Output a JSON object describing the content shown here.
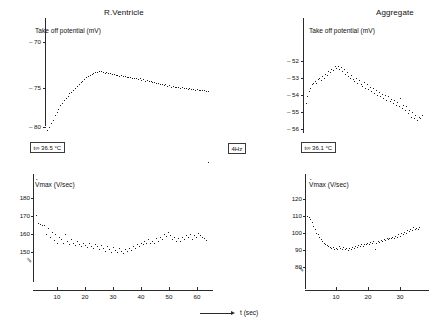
{
  "figure": {
    "xaxis_label": "t (sec)",
    "stimulus_box": "4Hz"
  },
  "panels": [
    {
      "id": "rv-top",
      "title": "R.Ventricle",
      "ylabel": "Take off potential (mV)",
      "ytick_labels": [
        "– 70",
        "– 75",
        "– 80"
      ],
      "annotation": {
        "symbol": "t",
        "subscript": "∞",
        "value": "36.5",
        "unit": "°C",
        "text": "t∞ 36.5 °C"
      }
    },
    {
      "id": "agg-top",
      "title": "Aggregate",
      "ylabel": "Take off potential (mV)",
      "ytick_labels": [
        "– 52",
        "– 53",
        "– 54",
        "– 55",
        "– 56"
      ],
      "annotation": {
        "symbol": "t",
        "subscript": "∞",
        "value": "36.1",
        "unit": "°C",
        "text": "t∞ 36.1 °C"
      }
    },
    {
      "id": "rv-bottom",
      "title": "",
      "ylabel": "Vmax (V/sec)",
      "ylabel_prefix": "V",
      "ylabel_suffix": "max (V/sec)",
      "ytick_labels": [
        "180",
        "170",
        "160",
        "150"
      ],
      "xtick_labels": [
        "10",
        "20",
        "30",
        "40",
        "50",
        "60"
      ]
    },
    {
      "id": "agg-bottom",
      "title": "",
      "ylabel": "Vmax (V/sec)",
      "ylabel_prefix": "V",
      "ylabel_suffix": "max (V/sec)",
      "ytick_labels": [
        "120",
        "110",
        "100",
        "90",
        "80"
      ],
      "xtick_labels": [
        "10",
        "20",
        "30"
      ]
    }
  ],
  "chart_data": [
    {
      "type": "scatter",
      "id": "rv-takeoff",
      "title": "R.Ventricle",
      "xlabel": "t (sec)",
      "ylabel": "Take off potential (mV)",
      "ylim": [
        -81.5,
        -68.5
      ],
      "xlim": [
        0,
        63
      ],
      "yticks": [
        -70,
        -75,
        -80
      ],
      "grid": false,
      "legend": null,
      "annotation": "t∞ 36.5 °C",
      "x": [
        0.5,
        1.2,
        1.9,
        2.6,
        3.3,
        4,
        4.7,
        5.4,
        6.1,
        6.8,
        7.5,
        8.2,
        8.9,
        9.6,
        10.3,
        11,
        11.7,
        12.4,
        13.1,
        13.8,
        14.5,
        15.2,
        15.9,
        16.6,
        17.3,
        18,
        18.7,
        19.4,
        20.1,
        20.8,
        21.5,
        22.2,
        22.9,
        23.6,
        24.3,
        25,
        25.7,
        26.4,
        27.1,
        27.8,
        28.5,
        29.2,
        29.9,
        30.6,
        31.3,
        32,
        32.7,
        33.4,
        34.1,
        34.8,
        35.5,
        36.2,
        36.9,
        37.6,
        38.3,
        39,
        39.7,
        40.4,
        41.1,
        41.8,
        42.5,
        43.2,
        43.9,
        44.6,
        45.3,
        46,
        46.7,
        47.4,
        48.1,
        48.8,
        49.5,
        50.2,
        50.9,
        51.6,
        52.3,
        53,
        53.7,
        54.4,
        55.1,
        55.8,
        56.5,
        57.2,
        57.9,
        58.6,
        59.3,
        60,
        60.7,
        61.4
      ],
      "y": [
        -80.4,
        -80.1,
        -79.6,
        -79.2,
        -78.7,
        -78.3,
        -77.9,
        -77.5,
        -77.2,
        -76.9,
        -76.6,
        -76.4,
        -76.1,
        -75.9,
        -75.7,
        -75.5,
        -75.2,
        -75.0,
        -74.8,
        -74.6,
        -74.4,
        -74.2,
        -74.0,
        -73.9,
        -73.8,
        -73.7,
        -73.6,
        -73.55,
        -73.5,
        -73.5,
        -73.6,
        -73.7,
        -73.6,
        -73.75,
        -73.7,
        -73.8,
        -73.85,
        -73.9,
        -73.95,
        -74.0,
        -73.95,
        -74.05,
        -74.1,
        -74.15,
        -74.2,
        -74.15,
        -74.25,
        -74.3,
        -74.35,
        -74.4,
        -74.35,
        -74.5,
        -74.45,
        -74.6,
        -74.55,
        -74.7,
        -74.65,
        -74.8,
        -74.75,
        -74.9,
        -74.85,
        -75.0,
        -74.95,
        -75.1,
        -75.05,
        -75.2,
        -75.15,
        -75.3,
        -75.25,
        -75.35,
        -75.3,
        -75.4,
        -75.45,
        -75.4,
        -75.5,
        -75.45,
        -75.55,
        -75.5,
        -75.6,
        -75.55,
        -75.65,
        -75.6,
        -75.7,
        -75.65,
        -75.75,
        -75.7,
        -75.8,
        -75.85
      ]
    },
    {
      "type": "scatter",
      "id": "agg-takeoff",
      "title": "Aggregate",
      "xlabel": "t (sec)",
      "ylabel": "Take off potential (mV)",
      "ylim": [
        -56.6,
        -51.4
      ],
      "xlim": [
        0,
        33
      ],
      "yticks": [
        -52,
        -53,
        -54,
        -55,
        -56
      ],
      "grid": false,
      "legend": null,
      "annotation": "t∞ 36.1 °C",
      "x": [
        0.4,
        0.8,
        1.2,
        1.6,
        2,
        2.4,
        2.8,
        3.2,
        3.6,
        4,
        4.4,
        4.8,
        5.2,
        5.6,
        6,
        6.4,
        6.8,
        7.2,
        7.6,
        8,
        8.4,
        8.8,
        9.2,
        9.6,
        10,
        10.4,
        10.8,
        11.2,
        11.6,
        12,
        12.4,
        12.8,
        13.2,
        13.6,
        14,
        14.4,
        14.8,
        15.2,
        15.6,
        16,
        16.4,
        16.8,
        17.2,
        17.6,
        18,
        18.4,
        18.8,
        19.2,
        19.6,
        20,
        20.4,
        20.8,
        21.2,
        21.6,
        22,
        22.4,
        22.8,
        23.2,
        23.6,
        24,
        24.4,
        24.8,
        25.2,
        25.6,
        26,
        26.4,
        26.8,
        27.2,
        27.6,
        28,
        28.4,
        28.8,
        29.2,
        29.6,
        30,
        30.4,
        30.8
      ],
      "y": [
        -54.5,
        -54.1,
        -53.8,
        -53.6,
        -53.4,
        -53.3,
        -53.2,
        -53.3,
        -53.1,
        -53.0,
        -53.15,
        -52.9,
        -53.0,
        -52.8,
        -52.85,
        -52.6,
        -52.7,
        -52.5,
        -52.55,
        -52.35,
        -52.45,
        -52.3,
        -52.5,
        -52.4,
        -52.6,
        -52.5,
        -52.8,
        -52.7,
        -52.9,
        -53.0,
        -52.85,
        -53.1,
        -53.2,
        -53.05,
        -53.3,
        -53.15,
        -53.4,
        -53.5,
        -53.25,
        -53.6,
        -53.4,
        -53.7,
        -53.55,
        -53.8,
        -53.6,
        -53.9,
        -53.75,
        -54.0,
        -53.85,
        -54.1,
        -53.95,
        -54.2,
        -54.0,
        -54.3,
        -54.1,
        -54.4,
        -54.25,
        -54.5,
        -54.3,
        -54.6,
        -54.45,
        -54.7,
        -54.2,
        -54.8,
        -54.6,
        -54.9,
        -54.7,
        -55.1,
        -54.9,
        -55.3,
        -55.0,
        -55.4,
        -55.2,
        -55.5,
        -55.3,
        -55.4,
        -55.2
      ]
    },
    {
      "type": "scatter",
      "id": "rv-vmax",
      "title": "",
      "xlabel": "t (sec)",
      "ylabel": "Vmax (V/sec)",
      "ylim": [
        144,
        184
      ],
      "xlim": [
        0,
        63
      ],
      "yticks": [
        180,
        170,
        160,
        150
      ],
      "xticks": [
        10,
        20,
        30,
        40,
        50,
        60
      ],
      "grid": false,
      "legend": null,
      "x": [
        0.6,
        1.3,
        2,
        2.7,
        3.4,
        4.1,
        4.8,
        5.5,
        6.2,
        6.9,
        7.6,
        8.3,
        9,
        9.7,
        10.4,
        11.1,
        11.8,
        12.5,
        13.2,
        13.9,
        14.6,
        15.3,
        16,
        16.7,
        17.4,
        18.1,
        18.8,
        19.5,
        20.2,
        20.9,
        21.6,
        22.3,
        23,
        23.7,
        24.4,
        25.1,
        25.8,
        26.5,
        27.2,
        27.9,
        28.6,
        29.3,
        30,
        30.7,
        31.4,
        32.1,
        32.8,
        33.5,
        34.2,
        34.9,
        35.6,
        36.3,
        37,
        37.7,
        38.4,
        39.1,
        39.8,
        40.5,
        41.2,
        41.9,
        42.6,
        43.3,
        44,
        44.7,
        45.4,
        46.1,
        46.8,
        47.5,
        48.2,
        48.9,
        49.6,
        50.3,
        51,
        51.7,
        52.4,
        53.1,
        53.8,
        54.5,
        55.2,
        55.9,
        56.6,
        57.3,
        58,
        58.7,
        59.4,
        60.1,
        60.8,
        61.5
      ],
      "y": [
        170.5,
        166,
        165.5,
        165,
        164.5,
        160,
        163,
        158,
        161,
        156.5,
        160,
        155,
        158,
        157,
        155,
        159.5,
        156,
        154,
        157,
        155,
        153.5,
        156,
        154,
        153,
        155,
        153.5,
        152.5,
        154.5,
        153,
        152,
        154,
        153,
        151.5,
        153.5,
        152,
        150.5,
        153,
        151.5,
        150,
        152.5,
        151,
        149.5,
        152,
        150.5,
        149,
        151.5,
        150.5,
        152,
        151,
        153,
        152,
        154,
        153,
        155,
        154,
        156,
        155,
        157,
        154.5,
        156,
        155,
        157.5,
        156,
        158,
        157,
        160,
        158.5,
        161,
        159,
        157,
        158,
        156,
        157.5,
        156,
        158,
        157,
        159,
        158,
        160,
        157,
        159,
        158,
        160.5,
        159,
        158,
        157.5,
        156.5
      ]
    },
    {
      "type": "scatter",
      "id": "agg-vmax",
      "title": "",
      "xlabel": "t (sec)",
      "ylabel": "Vmax (V/sec)",
      "ylim": [
        74,
        124
      ],
      "xlim": [
        0,
        33
      ],
      "yticks": [
        120,
        110,
        100,
        90,
        80
      ],
      "xticks": [
        10,
        20,
        30
      ],
      "grid": false,
      "legend": null,
      "x": [
        0.4,
        0.8,
        1.2,
        1.6,
        2,
        2.4,
        2.8,
        3.2,
        3.6,
        4,
        4.4,
        4.8,
        5.2,
        5.6,
        6,
        6.4,
        6.8,
        7.2,
        7.6,
        8,
        8.4,
        8.8,
        9.2,
        9.6,
        10,
        10.4,
        10.8,
        11.2,
        11.6,
        12,
        12.4,
        12.8,
        13.2,
        13.6,
        14,
        14.4,
        14.8,
        15.2,
        15.6,
        16,
        16.4,
        16.8,
        17.2,
        17.6,
        18,
        18.4,
        18.8,
        19.2,
        19.6,
        20,
        20.4,
        20.8,
        21.2,
        21.6,
        22,
        22.4,
        22.8,
        23.2,
        23.6,
        24,
        24.4,
        24.8,
        25.2,
        25.6,
        26,
        26.4,
        26.8,
        27.2,
        27.6,
        28,
        28.4,
        28.8,
        29.2,
        29.6,
        30,
        30.4
      ],
      "y": [
        110,
        109,
        108,
        106,
        104,
        102,
        100,
        99,
        97.5,
        96,
        95,
        94,
        93,
        92.5,
        92,
        91.5,
        91,
        91.5,
        90.5,
        91,
        90.5,
        92,
        91,
        90.5,
        91.5,
        90.5,
        91,
        90,
        91,
        90.5,
        91.5,
        91,
        92,
        91.5,
        92.5,
        92,
        93,
        92,
        93.5,
        93,
        94,
        93.5,
        94.5,
        94,
        95,
        90.5,
        94,
        95,
        94.5,
        95.5,
        95,
        96,
        95.5,
        96.5,
        96,
        97,
        96.5,
        97.5,
        97,
        98,
        97.5,
        99,
        98,
        100,
        99,
        100.5,
        100,
        101.5,
        101,
        102,
        101.5,
        103,
        102,
        102.5,
        102,
        103
      ]
    }
  ]
}
